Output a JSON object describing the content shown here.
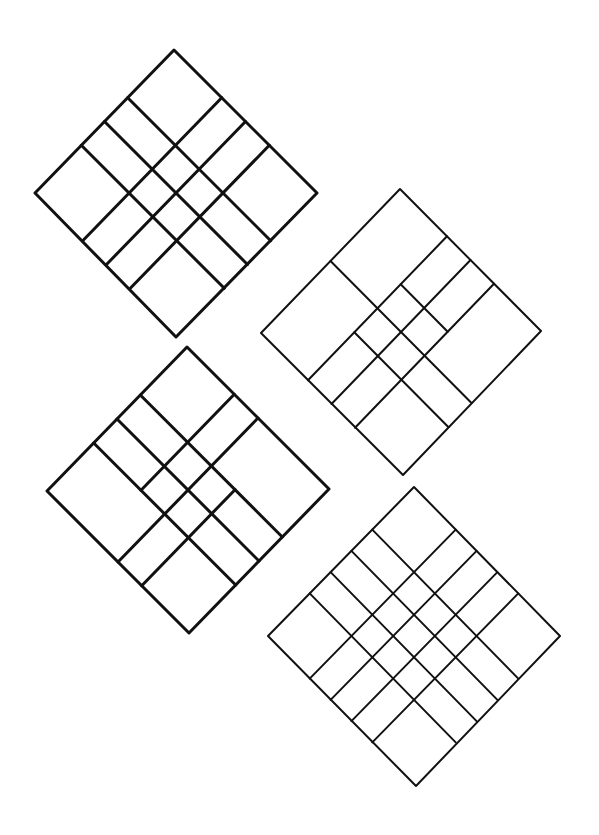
{
  "page": {
    "width": 599,
    "height": 835,
    "background": "#ffffff",
    "stroke_color": "#111111"
  },
  "diagrams": [
    {
      "id": "grid-diamond-1",
      "stroke_width": 3,
      "corners": {
        "top": [
          174,
          50
        ],
        "left": [
          35,
          193
        ],
        "right": [
          317,
          193
        ],
        "bottom": [
          176,
          337
        ]
      },
      "u_lines": [
        {
          "at": 0.3333,
          "from": 0,
          "to": 1
        },
        {
          "at": 0.5,
          "from": 0,
          "to": 1
        },
        {
          "at": 0.6667,
          "from": 0,
          "to": 1
        }
      ],
      "v_lines": [
        {
          "at": 0.3333,
          "from": 0,
          "to": 1
        },
        {
          "at": 0.5,
          "from": 0,
          "to": 1
        },
        {
          "at": 0.6667,
          "from": 0,
          "to": 1
        }
      ]
    },
    {
      "id": "grid-diamond-2",
      "stroke_width": 2,
      "corners": {
        "top": [
          400,
          189
        ],
        "left": [
          261,
          333
        ],
        "right": [
          541,
          331
        ],
        "bottom": [
          403,
          475
        ]
      },
      "u_lines": [
        {
          "at": 0.3333,
          "from": 0.3333,
          "to": 0.6667
        },
        {
          "at": 0.5,
          "from": 0,
          "to": 1
        },
        {
          "at": 0.6667,
          "from": 0.3333,
          "to": 1
        }
      ],
      "v_lines": [
        {
          "at": 0.3333,
          "from": 0,
          "to": 1
        },
        {
          "at": 0.5,
          "from": 0,
          "to": 1
        },
        {
          "at": 0.6667,
          "from": 0,
          "to": 1
        }
      ]
    },
    {
      "id": "grid-diamond-3",
      "stroke_width": 3,
      "corners": {
        "top": [
          187,
          347
        ],
        "left": [
          47,
          491
        ],
        "right": [
          329,
          489
        ],
        "bottom": [
          189,
          633
        ]
      },
      "u_lines": [
        {
          "at": 0.3333,
          "from": 0,
          "to": 1
        },
        {
          "at": 0.5,
          "from": 0,
          "to": 1
        },
        {
          "at": 0.6667,
          "from": 0,
          "to": 1
        }
      ],
      "v_lines": [
        {
          "at": 0.3333,
          "from": 0,
          "to": 0.6667
        },
        {
          "at": 0.5,
          "from": 0,
          "to": 1
        },
        {
          "at": 0.6667,
          "from": 0.3333,
          "to": 1
        }
      ]
    },
    {
      "id": "grid-diamond-4",
      "stroke_width": 2,
      "corners": {
        "top": [
          414,
          487
        ],
        "left": [
          268,
          636
        ],
        "right": [
          560,
          636
        ],
        "bottom": [
          416,
          786
        ]
      },
      "u_lines": [
        {
          "at": 0.2857,
          "from": 0,
          "to": 1
        },
        {
          "at": 0.4286,
          "from": 0,
          "to": 1
        },
        {
          "at": 0.5714,
          "from": 0,
          "to": 1
        },
        {
          "at": 0.7143,
          "from": 0,
          "to": 1
        }
      ],
      "v_lines": [
        {
          "at": 0.2857,
          "from": 0,
          "to": 1
        },
        {
          "at": 0.4286,
          "from": 0,
          "to": 1
        },
        {
          "at": 0.5714,
          "from": 0,
          "to": 1
        },
        {
          "at": 0.7143,
          "from": 0,
          "to": 1
        }
      ]
    }
  ]
}
